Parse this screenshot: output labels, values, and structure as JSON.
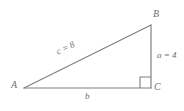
{
  "figure": {
    "type": "right-triangle-diagram",
    "background_color": "#ffffff",
    "stroke_color": "#808080",
    "label_color": "#6e6e6e",
    "vertices": {
      "A": {
        "label": "A",
        "x": 24,
        "y": 88
      },
      "B": {
        "label": "B",
        "x": 151,
        "y": 25
      },
      "C": {
        "label": "C",
        "x": 151,
        "y": 88
      }
    },
    "sides": {
      "hypotenuse": {
        "label": "c = 8",
        "name": "c",
        "value": 8,
        "from": "A",
        "to": "B"
      },
      "vertical_leg": {
        "label": "a = 4",
        "name": "a",
        "value": 4,
        "from": "B",
        "to": "C"
      },
      "base_leg": {
        "label": "b",
        "name": "b",
        "value": "",
        "from": "A",
        "to": "C"
      }
    },
    "right_angle": {
      "at_vertex": "C",
      "marker": "square",
      "size": 11
    }
  }
}
